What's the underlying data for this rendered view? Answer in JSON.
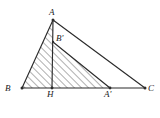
{
  "figure": {
    "caption": "",
    "stroke_color": "#2b2b2b",
    "hatch_color": "#4d4d4d",
    "background_color": "#ffffff",
    "labels": {
      "A": "A",
      "B": "B",
      "C": "C",
      "H": "H",
      "A_prime": "A'",
      "B_prime": "B'"
    },
    "points": {
      "A": {
        "x": 53,
        "y": 20
      },
      "B": {
        "x": 22,
        "y": 88
      },
      "C": {
        "x": 145,
        "y": 88
      },
      "H": {
        "x": 52,
        "y": 88
      },
      "A_prime": {
        "x": 110,
        "y": 88
      },
      "B_prime": {
        "x": 53,
        "y": 42
      }
    },
    "label_positions": {
      "A": {
        "x": 49,
        "y": 8
      },
      "B": {
        "x": 5,
        "y": 84
      },
      "C": {
        "x": 148,
        "y": 84
      },
      "H": {
        "x": 47,
        "y": 90
      },
      "A_prime": {
        "x": 104,
        "y": 90
      },
      "B_prime": {
        "x": 56,
        "y": 34
      }
    },
    "segments": [
      {
        "name": "side-AB",
        "from": "A",
        "to": "B"
      },
      {
        "name": "side-AC",
        "from": "A",
        "to": "C"
      },
      {
        "name": "side-BC",
        "from": "B",
        "to": "C"
      },
      {
        "name": "altitude-AH",
        "from": "A",
        "to": "H"
      },
      {
        "name": "segment-BprimeAprime",
        "from": "B_prime",
        "to": "A_prime"
      }
    ],
    "hatched_regions": [
      {
        "name": "triangle-ABH",
        "vertices": [
          "A",
          "B",
          "H"
        ]
      },
      {
        "name": "triangle-BprimeHAprime",
        "vertices": [
          "B_prime",
          "H",
          "A_prime"
        ]
      }
    ]
  }
}
